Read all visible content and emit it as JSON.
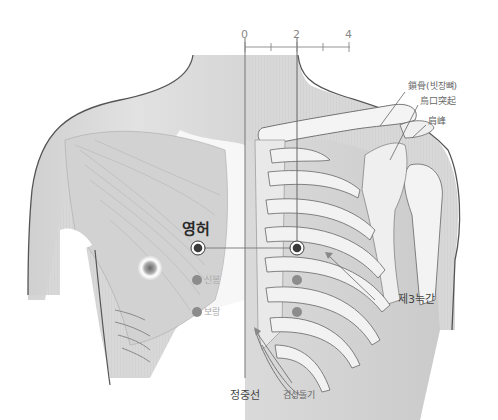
{
  "figure": {
    "scale": {
      "tick_labels": [
        "0",
        "2",
        "4"
      ],
      "unit_note": "cun scale from midline"
    },
    "acupoints": [
      {
        "name": "영허",
        "role": "primary",
        "level": "3rd intercostal space",
        "offset_from_midline": 2
      },
      {
        "name": "신봉",
        "role": "secondary",
        "offset_from_midline": 2
      },
      {
        "name": "보랑",
        "role": "secondary",
        "offset_from_midline": 2
      }
    ],
    "labels": {
      "primary_point": "영허",
      "point_2": "신봉",
      "point_3": "보랑",
      "clavicle": "鎖骨(빗장뼈)",
      "coracoid": "烏口突起",
      "acromion": "肩峰",
      "intercostal": "제3늑간",
      "midline": "정중선",
      "xiphoid": "검상돌기"
    },
    "colors": {
      "point_dark": "#3a3a3a",
      "point_grey": "#8c8c8c",
      "outline": "#555555",
      "skin": "#d9d9d9",
      "bone": "#f2f2f2"
    }
  }
}
